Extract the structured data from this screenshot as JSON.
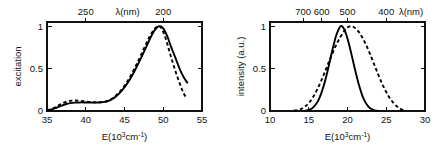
{
  "figure": {
    "background": "#ffffff",
    "ink_color": "#000000",
    "panel_count": 2
  },
  "chart_data": [
    {
      "id": "left-panel",
      "type": "line",
      "title": "",
      "xlabel": "E(10³cm⁻¹)",
      "ylabel": "excitation",
      "xlim": [
        35,
        55
      ],
      "ylim": [
        0,
        1.05
      ],
      "grid": false,
      "legend": "none",
      "xticks": [
        35,
        40,
        45,
        50,
        55
      ],
      "xticklabels": [
        "35",
        "40",
        "45",
        "50",
        "55"
      ],
      "yticks": [
        0,
        0.5,
        1
      ],
      "yticklabels": [
        "0",
        "0.5",
        "1"
      ],
      "top_axis": {
        "label": "λ(nm)",
        "unit": "nm",
        "ticks": [
          250,
          200
        ],
        "ticklabels": [
          "250",
          "200"
        ],
        "tick_positions_in_x": [
          40.0,
          50.0
        ],
        "label_position_in_x": 45.4
      },
      "series": [
        {
          "name": "excitation-solid",
          "style": "solid",
          "x": [
            35.0,
            35.6,
            36.2,
            36.8,
            37.4,
            38.0,
            38.6,
            39.2,
            39.8,
            40.4,
            41.0,
            41.6,
            42.2,
            42.8,
            43.4,
            44.0,
            44.6,
            45.2,
            45.8,
            46.4,
            47.0,
            47.6,
            48.2,
            48.8,
            49.3,
            49.6,
            50.0,
            50.5,
            51.0,
            51.6,
            52.2,
            52.7,
            53.1
          ],
          "y": [
            0.005,
            0.018,
            0.038,
            0.06,
            0.08,
            0.093,
            0.099,
            0.101,
            0.101,
            0.1,
            0.099,
            0.1,
            0.104,
            0.115,
            0.14,
            0.18,
            0.235,
            0.305,
            0.39,
            0.49,
            0.6,
            0.715,
            0.835,
            0.94,
            0.993,
            1.0,
            0.975,
            0.885,
            0.76,
            0.62,
            0.48,
            0.39,
            0.335
          ]
        },
        {
          "name": "excitation-dashed",
          "style": "dashed",
          "x": [
            35.0,
            35.6,
            36.2,
            36.8,
            37.4,
            38.0,
            38.6,
            39.2,
            39.8,
            40.4,
            41.0,
            41.6,
            42.2,
            42.8,
            43.4,
            44.0,
            44.6,
            45.2,
            45.8,
            46.4,
            47.0,
            47.6,
            48.2,
            48.8,
            49.2,
            49.5,
            49.9,
            50.4,
            50.9,
            51.5,
            52.1,
            52.6,
            53.0
          ],
          "y": [
            0.006,
            0.024,
            0.052,
            0.082,
            0.106,
            0.12,
            0.124,
            0.121,
            0.115,
            0.108,
            0.103,
            0.102,
            0.107,
            0.12,
            0.148,
            0.192,
            0.25,
            0.325,
            0.415,
            0.52,
            0.635,
            0.755,
            0.87,
            0.96,
            0.995,
            1.0,
            0.955,
            0.83,
            0.67,
            0.49,
            0.33,
            0.215,
            0.15
          ]
        }
      ]
    },
    {
      "id": "right-panel",
      "type": "line",
      "title": "",
      "xlabel": "E(10³cm⁻¹)",
      "ylabel": "intensity (a.u.)",
      "xlim": [
        10,
        30
      ],
      "ylim": [
        0,
        1.05
      ],
      "grid": false,
      "legend": "none",
      "xticks": [
        10,
        15,
        20,
        25,
        30
      ],
      "xticklabels": [
        "10",
        "15",
        "20",
        "25",
        "30"
      ],
      "yticks": [
        0,
        0.5,
        1
      ],
      "yticklabels": [
        "0",
        "0.5",
        "1"
      ],
      "top_axis": {
        "label": "λ(nm)",
        "unit": "nm",
        "ticks": [
          700,
          600,
          500,
          400
        ],
        "ticklabels": [
          "700",
          "600",
          "500",
          "400"
        ],
        "tick_positions_in_x": [
          14.286,
          16.667,
          20.0,
          25.0
        ],
        "label_position_in_x": 28.2
      },
      "series": [
        {
          "name": "emission-solid",
          "style": "solid",
          "peak_x": 19.1,
          "x": [
            14.6,
            15.0,
            15.4,
            15.8,
            16.2,
            16.6,
            17.0,
            17.4,
            17.8,
            18.2,
            18.6,
            19.1,
            19.5,
            19.9,
            20.3,
            20.7,
            21.1,
            21.5,
            21.9,
            22.3,
            22.7,
            23.1,
            23.5,
            23.9
          ],
          "y": [
            0.004,
            0.012,
            0.03,
            0.065,
            0.12,
            0.205,
            0.32,
            0.46,
            0.62,
            0.775,
            0.905,
            1.0,
            0.975,
            0.885,
            0.75,
            0.595,
            0.44,
            0.3,
            0.185,
            0.105,
            0.052,
            0.022,
            0.008,
            0.002
          ]
        },
        {
          "name": "emission-dashed",
          "style": "dashed",
          "peak_x": 20.4,
          "x": [
            13.1,
            13.6,
            14.1,
            14.6,
            15.1,
            15.6,
            16.1,
            16.6,
            17.1,
            17.6,
            18.1,
            18.6,
            19.1,
            19.6,
            20.0,
            20.4,
            20.9,
            21.4,
            21.9,
            22.4,
            22.9,
            23.4,
            23.9,
            24.4,
            24.9,
            25.4,
            25.9,
            26.4,
            26.9,
            27.3
          ],
          "y": [
            0.004,
            0.012,
            0.028,
            0.058,
            0.105,
            0.17,
            0.255,
            0.355,
            0.465,
            0.58,
            0.69,
            0.79,
            0.875,
            0.945,
            0.985,
            1.0,
            0.985,
            0.94,
            0.87,
            0.78,
            0.675,
            0.56,
            0.445,
            0.335,
            0.24,
            0.16,
            0.098,
            0.052,
            0.022,
            0.008
          ]
        }
      ]
    }
  ]
}
